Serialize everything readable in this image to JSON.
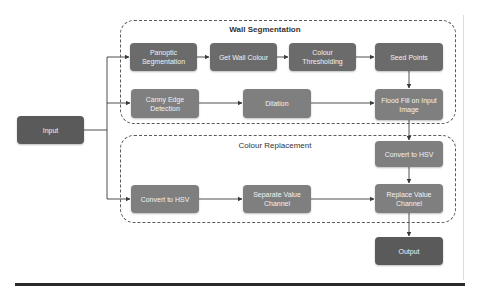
{
  "diagram": {
    "groups": {
      "wall_segmentation": {
        "title": "Wall Segmentation"
      },
      "colour_replacement": {
        "title": "Colour Replacement"
      }
    },
    "nodes": {
      "input": "Input",
      "panoptic": "Panoptic Segmentation",
      "get_wall_colour": "Get Wall Colour",
      "colour_thresholding": "Colour Thresholding",
      "seed_points": "Seed Points",
      "canny": "Canny Edge Detection",
      "dilation": "Dilation",
      "flood_fill": "Flood Fill on Input Image",
      "convert_hsv_right": "Convert to HSV",
      "convert_hsv_left": "Convert to HSV",
      "separate_value": "Separate Value Channel",
      "replace_value": "Replace Value Channel",
      "output": "Output"
    },
    "edges": [
      [
        "Input",
        "Panoptic Segmentation"
      ],
      [
        "Input",
        "Canny Edge Detection"
      ],
      [
        "Input",
        "Convert to HSV (left)"
      ],
      [
        "Panoptic Segmentation",
        "Get Wall Colour"
      ],
      [
        "Get Wall Colour",
        "Colour Thresholding"
      ],
      [
        "Colour Thresholding",
        "Seed Points"
      ],
      [
        "Seed Points",
        "Flood Fill on Input Image"
      ],
      [
        "Canny Edge Detection",
        "Dilation"
      ],
      [
        "Dilation",
        "Flood Fill on Input Image"
      ],
      [
        "Flood Fill on Input Image",
        "Convert to HSV (right)"
      ],
      [
        "Convert to HSV (right)",
        "Replace Value Channel"
      ],
      [
        "Convert to HSV (left)",
        "Separate Value Channel"
      ],
      [
        "Separate Value Channel",
        "Replace Value Channel"
      ],
      [
        "Replace Value Channel",
        "Output"
      ]
    ],
    "colors": {
      "dark_node": "#5a5a5a",
      "mid_node": "#6b6b6b",
      "light_node": "#7f7f7f",
      "line": "#3a3a3a"
    }
  }
}
